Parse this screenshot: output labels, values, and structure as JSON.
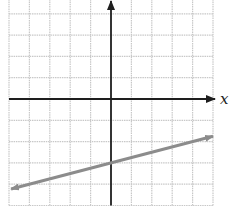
{
  "chart_data": {
    "type": "line",
    "title": "",
    "xlabel": "x",
    "ylabel": "",
    "xlim": [
      -5,
      5
    ],
    "ylim": [
      -5,
      4.7
    ],
    "grid": true,
    "grid_step": 1,
    "legend": null,
    "series": [
      {
        "name": "line",
        "equation": "y = x/4 - 3",
        "slope": 0.25,
        "y_intercept": -3,
        "x": [
          -4.9,
          5
        ],
        "y": [
          -4.225,
          -1.75
        ],
        "arrows": "both",
        "color": "#8c8c8c"
      }
    ],
    "axes": {
      "x_arrow": true,
      "y_arrow": true,
      "color": "#1e1e1e"
    },
    "colors": {
      "grid": "#c8c8c8",
      "axis": "#1e1e1e",
      "line": "#8c8c8c"
    }
  },
  "labels": {
    "x_axis": "x"
  }
}
